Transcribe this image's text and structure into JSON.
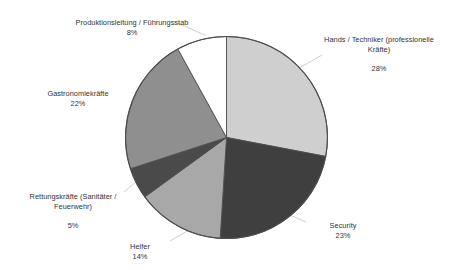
{
  "chart_data": {
    "type": "pie",
    "title": "",
    "subtitle": "",
    "xlabel": "",
    "ylabel": "",
    "legend_position": "none",
    "grid": false,
    "start_angle_deg": 0,
    "direction": "clockwise",
    "categories": [
      "Hands / Techniker (professionelle Kräfte)",
      "Security",
      "Helfer",
      "Rettungskräfte (Sanitäter / Feuerwehr)",
      "Gastronomiekräfte",
      "Produktionsleitung / Führungsstab"
    ],
    "values": [
      28,
      23,
      14,
      5,
      22,
      8
    ],
    "value_unit": "%",
    "slices": [
      {
        "name": "hands-techniker",
        "label_line1": "Hands / Techniker (professionelle",
        "label_line2": "Kräfte)",
        "percent_text": "28%",
        "value": 28,
        "color": "#cfcfcf"
      },
      {
        "name": "security",
        "label_line1": "Security",
        "label_line2": "",
        "percent_text": "23%",
        "value": 23,
        "color": "#3f3f3f"
      },
      {
        "name": "helfer",
        "label_line1": "Helfer",
        "label_line2": "",
        "percent_text": "14%",
        "value": 14,
        "color": "#a8a8a8"
      },
      {
        "name": "rettungskraefte",
        "label_line1": "Rettungskräfte (Sanitäter /",
        "label_line2": "Feuerwehr)",
        "percent_text": "5%",
        "value": 5,
        "color": "#4a4a4a"
      },
      {
        "name": "gastronomiekraefte",
        "label_line1": "Gastronomiekräfte",
        "label_line2": "",
        "percent_text": "22%",
        "value": 22,
        "color": "#8f8f8f"
      },
      {
        "name": "produktionsleitung",
        "label_line1": "Produktionsleitung / Führungsstab",
        "label_line2": "",
        "percent_text": "8%",
        "value": 8,
        "color": "#ffffff"
      }
    ],
    "colors": {
      "outline": "#4d4d4d",
      "leader_line": "#b9b9b9",
      "text": "#333333",
      "background": "#ffffff"
    }
  }
}
